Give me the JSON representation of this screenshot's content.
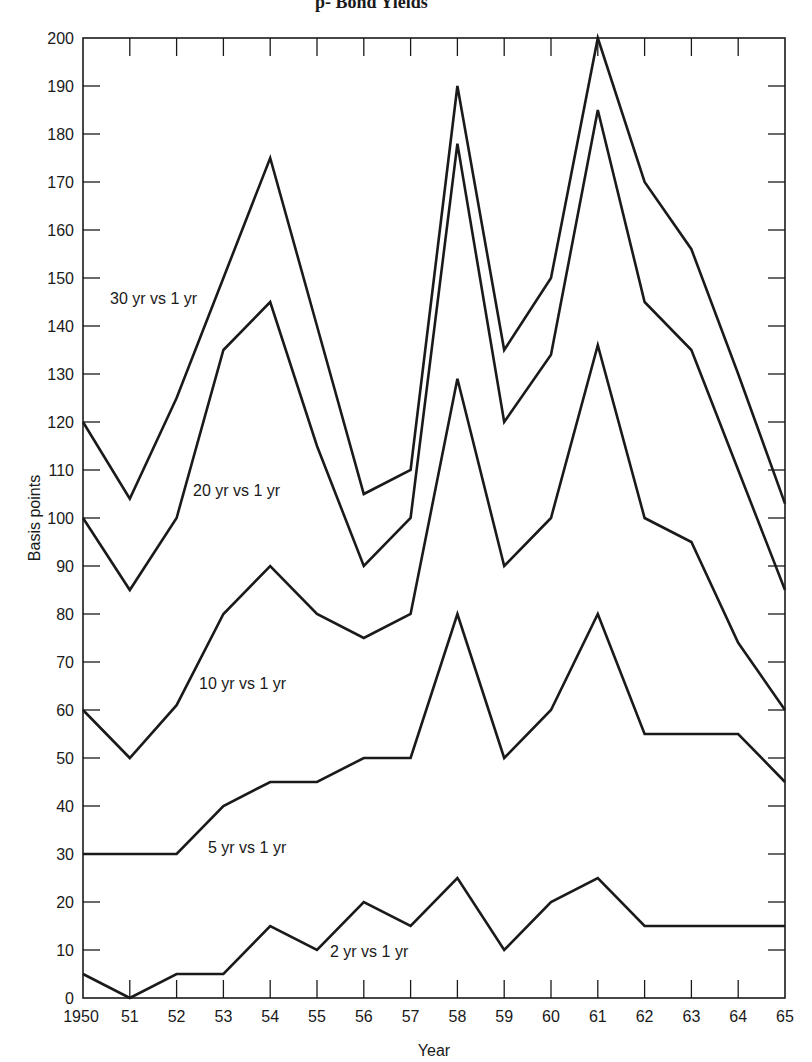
{
  "title_fragment": "p- Bond Yields",
  "chart_data": {
    "type": "line",
    "title": "",
    "xlabel": "Year",
    "ylabel": "Basis points",
    "ylim": [
      0,
      200
    ],
    "y_ticks": [
      0,
      10,
      20,
      30,
      40,
      50,
      60,
      70,
      80,
      90,
      100,
      110,
      120,
      130,
      140,
      150,
      160,
      170,
      180,
      190,
      200
    ],
    "x": [
      1950,
      1951,
      1952,
      1953,
      1954,
      1955,
      1956,
      1957,
      1958,
      1959,
      1960,
      1961,
      1962,
      1963,
      1964,
      1965
    ],
    "x_tick_labels": [
      "1950",
      "51",
      "52",
      "53",
      "54",
      "55",
      "56",
      "57",
      "58",
      "59",
      "60",
      "61",
      "62",
      "63",
      "64",
      "65"
    ],
    "grid": false,
    "legend": "inline labels",
    "line_color": "#1a1a1a",
    "series": [
      {
        "name": "30 yr vs 1 yr",
        "values": [
          120,
          104,
          125,
          150,
          175,
          140,
          105,
          110,
          190,
          135,
          150,
          200,
          170,
          156,
          130,
          103
        ],
        "label_pos": {
          "x": 110,
          "y": 304
        }
      },
      {
        "name": "20 yr vs 1 yr",
        "values": [
          100,
          85,
          100,
          135,
          145,
          115,
          90,
          100,
          178,
          120,
          134,
          185,
          145,
          135,
          110,
          85
        ],
        "label_pos": {
          "x": 193,
          "y": 496
        }
      },
      {
        "name": "10 yr vs 1 yr",
        "values": [
          60,
          50,
          61,
          80,
          90,
          80,
          75,
          80,
          129,
          90,
          100,
          136,
          100,
          95,
          74,
          60
        ],
        "label_pos": {
          "x": 199,
          "y": 689
        }
      },
      {
        "name": "5 yr vs 1 yr",
        "values": [
          30,
          30,
          30,
          40,
          45,
          45,
          50,
          50,
          80,
          50,
          60,
          80,
          55,
          55,
          55,
          45
        ],
        "label_pos": {
          "x": 208,
          "y": 853
        }
      },
      {
        "name": "2 yr vs 1 yr",
        "values": [
          5,
          0,
          5,
          5,
          15,
          10,
          20,
          15,
          25,
          10,
          20,
          25,
          15,
          15,
          15,
          15
        ],
        "label_pos": {
          "x": 330,
          "y": 957
        }
      }
    ]
  }
}
